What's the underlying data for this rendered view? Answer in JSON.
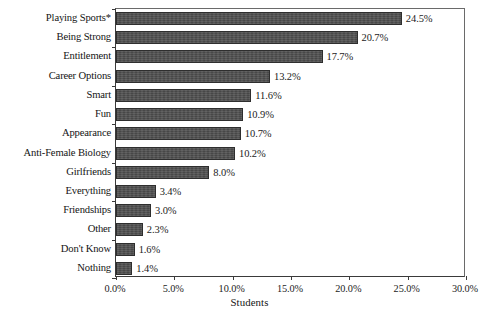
{
  "chart_data": {
    "type": "bar",
    "orientation": "horizontal",
    "title": "",
    "xlabel": "Students",
    "ylabel": "",
    "xlim": [
      0,
      30
    ],
    "xtick_labels": [
      "0.0%",
      "5.0%",
      "10.0%",
      "15.0%",
      "20.0%",
      "25.0%",
      "30.0%"
    ],
    "xtick_values": [
      0,
      5,
      10,
      15,
      20,
      25,
      30
    ],
    "grid": false,
    "legend": false,
    "value_label_suffix": "%",
    "bar_color": "#4e4e4e",
    "bar_edge_color": "#2e2e2e",
    "axis_color": "#3a3a3a",
    "categories": [
      "Playing Sports*",
      "Being Strong",
      "Entitlement",
      "Career Options",
      "Smart",
      "Fun",
      "Appearance",
      "Anti-Female Biology",
      "Girlfriends",
      "Everything",
      "Friendships",
      "Other",
      "Don't Know",
      "Nothing"
    ],
    "values": [
      24.5,
      20.7,
      17.7,
      13.2,
      11.6,
      10.9,
      10.7,
      10.2,
      8.0,
      3.4,
      3.0,
      2.3,
      1.6,
      1.4
    ],
    "value_labels": [
      "24.5%",
      "20.7%",
      "17.7%",
      "13.2%",
      "11.6%",
      "10.9%",
      "10.7%",
      "10.2%",
      "8.0%",
      "3.4%",
      "3.0%",
      "2.3%",
      "1.6%",
      "1.4%"
    ]
  }
}
